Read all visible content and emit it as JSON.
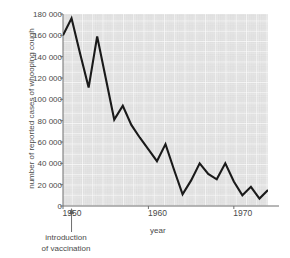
{
  "chart_data": {
    "type": "line",
    "title": "",
    "xlabel": "year",
    "ylabel": "number of reported cases of whooping cough",
    "xlim": [
      1950,
      1974
    ],
    "ylim": [
      0,
      180000
    ],
    "grid": true,
    "legend": "none",
    "x_tick_labels": [
      "1950",
      "1960",
      "1970"
    ],
    "x_tick_values": [
      1950,
      1960,
      1970
    ],
    "y_tick_labels": [
      "0",
      "20 000",
      "40 000",
      "60 000",
      "80 000",
      "100 000",
      "120 000",
      "140 000",
      "160 000",
      "180 000"
    ],
    "y_tick_values": [
      0,
      20000,
      40000,
      60000,
      80000,
      100000,
      120000,
      140000,
      160000,
      180000
    ],
    "x": [
      1950,
      1951,
      1952,
      1953,
      1954,
      1955,
      1956,
      1957,
      1958,
      1959,
      1960,
      1961,
      1962,
      1963,
      1964,
      1965,
      1966,
      1967,
      1968,
      1969,
      1970,
      1971,
      1972,
      1973,
      1974
    ],
    "values": [
      160000,
      176000,
      143000,
      111000,
      159000,
      120000,
      81000,
      94000,
      76000,
      64000,
      53000,
      42000,
      58000,
      34000,
      11000,
      24000,
      40000,
      30000,
      25000,
      40000,
      23000,
      10000,
      18000,
      7000,
      15000
    ],
    "series": [
      {
        "name": "reported cases of whooping cough",
        "color": "#1a1a1a",
        "values": [
          160000,
          176000,
          143000,
          111000,
          159000,
          120000,
          81000,
          94000,
          76000,
          64000,
          53000,
          42000,
          58000,
          34000,
          11000,
          24000,
          40000,
          30000,
          25000,
          40000,
          23000,
          10000,
          18000,
          7000,
          15000
        ]
      }
    ],
    "annotations": [
      {
        "name": "introduction-of-vaccination",
        "line1": "introduction",
        "line2": "of vaccination",
        "x_value": 1951,
        "arrow": "up"
      }
    ],
    "colors": {
      "plot_background": "#dcdcdc",
      "gridline": "#ffffff",
      "line": "#1a1a1a",
      "axis": "#6f6f6f",
      "text": "#4a4a4a"
    }
  }
}
